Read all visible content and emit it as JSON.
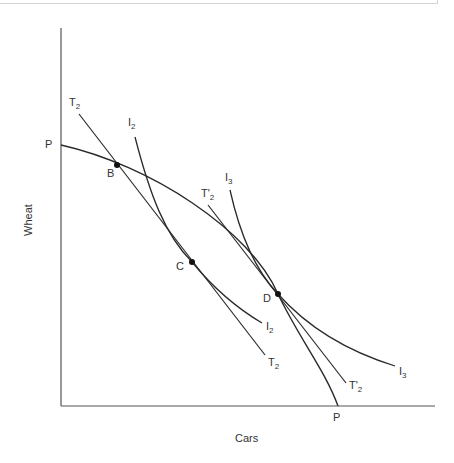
{
  "diagram": {
    "type": "economics-trade-diagram",
    "axes": {
      "x_label": "Cars",
      "y_label": "Wheat"
    },
    "curves": [
      {
        "id": "PP",
        "kind": "production-possibility-frontier",
        "label_start": "P",
        "label_end": "P"
      },
      {
        "id": "T2",
        "kind": "terms-of-trade-line",
        "label_main": "T",
        "label_sub": "2"
      },
      {
        "id": "T2prime",
        "kind": "terms-of-trade-line",
        "label_main": "T'",
        "label_sub": "2"
      },
      {
        "id": "I2",
        "kind": "indifference-curve",
        "label_main": "I",
        "label_sub": "2"
      },
      {
        "id": "I3",
        "kind": "indifference-curve",
        "label_main": "I",
        "label_sub": "3"
      }
    ],
    "points": [
      {
        "id": "B",
        "label": "B"
      },
      {
        "id": "C",
        "label": "C"
      },
      {
        "id": "D",
        "label": "D"
      }
    ]
  },
  "labels": {
    "P_top": "P",
    "P_bottom": "P",
    "T2_top": {
      "main": "T",
      "sub": "2"
    },
    "T2_bottom": {
      "main": "T",
      "sub": "2"
    },
    "I2_top": {
      "main": "I",
      "sub": "2"
    },
    "I2_bottom": {
      "main": "I",
      "sub": "2"
    },
    "I3_top": {
      "main": "I",
      "sub": "3"
    },
    "I3_bottom": {
      "main": "I",
      "sub": "3"
    },
    "T2p_top": {
      "main": "T'",
      "sub": "2"
    },
    "T2p_bottom": {
      "main": "T'",
      "sub": "2"
    },
    "B": "B",
    "C": "C",
    "D": "D",
    "x_axis": "Cars",
    "y_axis": "Wheat"
  },
  "colors": {
    "line": "#2a2a2a",
    "axis": "#555555",
    "text": "#333333"
  }
}
